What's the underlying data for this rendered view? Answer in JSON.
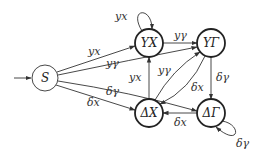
{
  "diagram": {
    "type": "automaton",
    "nodes": [
      {
        "id": "S",
        "label": "S",
        "x": 45,
        "y": 78,
        "initial": true,
        "thick": false
      },
      {
        "id": "YX",
        "label": "YX",
        "x": 149,
        "y": 43,
        "thick": true
      },
      {
        "id": "YG",
        "label": "YΓ",
        "x": 211,
        "y": 43,
        "thick": true
      },
      {
        "id": "DX",
        "label": "ΔX",
        "x": 149,
        "y": 113,
        "thick": true
      },
      {
        "id": "DG",
        "label": "ΔΓ",
        "x": 211,
        "y": 113,
        "thick": true
      }
    ],
    "edges": [
      {
        "from": "S",
        "to": "YX",
        "label": "yx"
      },
      {
        "from": "S",
        "to": "YG",
        "label": "yγ"
      },
      {
        "from": "S",
        "to": "DG",
        "label": "δγ"
      },
      {
        "from": "S",
        "to": "DX",
        "label": "δx"
      },
      {
        "from": "YX",
        "to": "YX",
        "label": "yx"
      },
      {
        "from": "YX",
        "to": "YG",
        "label": "yγ"
      },
      {
        "from": "DX",
        "to": "YX",
        "label": "yx"
      },
      {
        "from": "DX",
        "to": "YG",
        "label": "yγ"
      },
      {
        "from": "YG",
        "to": "DX",
        "label": "δx"
      },
      {
        "from": "YG",
        "to": "DG",
        "label": "δγ"
      },
      {
        "from": "DG",
        "to": "DX",
        "label": "δx"
      },
      {
        "from": "DG",
        "to": "DG",
        "label": "δγ"
      }
    ]
  }
}
